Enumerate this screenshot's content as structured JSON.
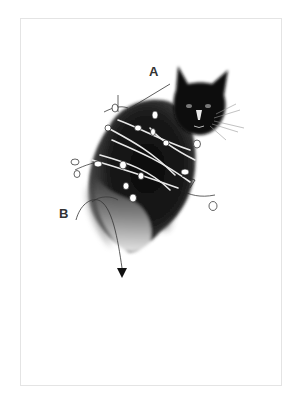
{
  "illustration": {
    "subject": "black cat entwined with leafy vines",
    "labels": {
      "a": "A",
      "b": "B"
    },
    "colors": {
      "background": "#ffffff",
      "border": "#e4e4e4",
      "ink": "#111111",
      "label": "#333333"
    }
  }
}
